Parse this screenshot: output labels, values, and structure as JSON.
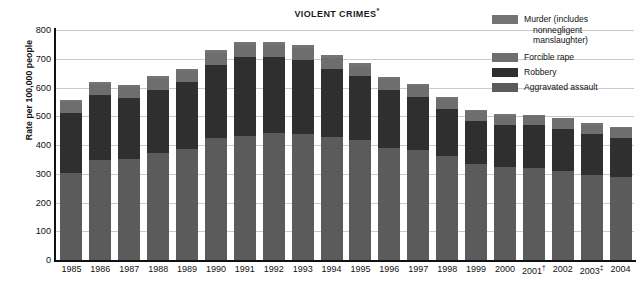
{
  "chart_data": {
    "type": "bar",
    "subtype": "stacked-bar",
    "title": "VIOLENT CRIMES",
    "title_superscript": "*",
    "xlabel": "",
    "ylabel": "Rate per 100,000 people",
    "ylim": [
      0,
      800
    ],
    "ytick_step": 100,
    "yticks": [
      0,
      100,
      200,
      300,
      400,
      500,
      600,
      700,
      800
    ],
    "ytick_labels": [
      "0",
      "100",
      "200",
      "300",
      "400",
      "500",
      "600",
      "700",
      "800"
    ],
    "grid": true,
    "legend_position": "top-right",
    "categories": [
      "1985",
      "1986",
      "1987",
      "1988",
      "1989",
      "1990",
      "1991",
      "1992",
      "1993",
      "1994",
      "1995",
      "1996",
      "1997",
      "1998",
      "1999",
      "2000",
      "2001",
      "2002",
      "2003",
      "2004"
    ],
    "category_superscripts": {
      "2001": "†",
      "2003": "‡"
    },
    "series": [
      {
        "name": "Aggravated assault",
        "color": "#5b5b5b",
        "values": [
          303,
          347,
          352,
          372,
          385,
          423,
          433,
          442,
          440,
          427,
          418,
          391,
          382,
          361,
          334,
          324,
          319,
          310,
          295,
          289
        ]
      },
      {
        "name": "Robbery",
        "color": "#2f2f2f",
        "values": [
          209,
          226,
          213,
          221,
          234,
          257,
          273,
          264,
          256,
          238,
          221,
          202,
          186,
          166,
          150,
          145,
          149,
          146,
          142,
          137
        ]
      },
      {
        "name": "Forcible rape",
        "color": "#6e6e6e",
        "values": [
          37,
          38,
          37,
          38,
          38,
          41,
          42,
          43,
          41,
          39,
          37,
          36,
          36,
          34,
          33,
          32,
          32,
          33,
          32,
          32
        ]
      },
      {
        "name": "Murder (includes nonnegligent manslaughter)",
        "color": "#747474",
        "values": [
          8,
          9,
          8,
          8,
          9,
          9,
          10,
          9,
          10,
          9,
          8,
          7,
          7,
          6,
          6,
          6,
          6,
          6,
          6,
          6
        ]
      }
    ],
    "totals": [
      557,
      620,
      610,
      639,
      666,
      730,
      758,
      758,
      747,
      713,
      684,
      636,
      611,
      567,
      523,
      507,
      506,
      495,
      475,
      464
    ]
  },
  "legend": {
    "items": [
      {
        "label_line1": "Murder (includes",
        "label_line2": "nonnegligent",
        "label_line3": "manslaughter)",
        "color": "#747474"
      },
      {
        "label_line1": "Forcible rape",
        "color": "#6e6e6e"
      },
      {
        "label_line1": "Robbery",
        "color": "#2f2f2f"
      },
      {
        "label_line1": "Aggravated assault",
        "color": "#5b5b5b"
      }
    ]
  }
}
